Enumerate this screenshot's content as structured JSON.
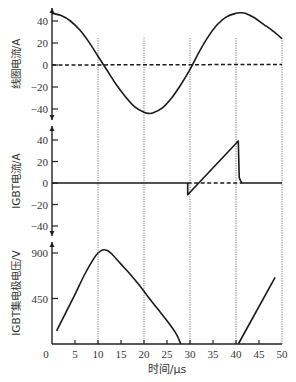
{
  "chart_data": {
    "type": "line",
    "title": "",
    "xlabel": "时间/µs",
    "xlim": [
      0,
      50
    ],
    "x_ticks": [
      0,
      5,
      10,
      15,
      20,
      25,
      30,
      35,
      40,
      45,
      50
    ],
    "vertical_dotted_lines_at": [
      10,
      20,
      30,
      40,
      50
    ],
    "grid": false,
    "panels": [
      {
        "id": "coil-current",
        "ylabel": "线圈电流/A",
        "ylim": [
          -50,
          50
        ],
        "y_ticks": [
          40,
          20,
          0,
          -20,
          -40
        ],
        "series": [
          {
            "name": "线圈电流",
            "style": "solid",
            "x": [
              0,
              2,
              4,
              6,
              8,
              10,
              12,
              14,
              16,
              18,
              20,
              21,
              22,
              24,
              26,
              28,
              30,
              32,
              34,
              36,
              38,
              40,
              41,
              42,
              44,
              46,
              48,
              50
            ],
            "y": [
              47,
              45,
              40,
              32,
              21,
              8,
              -5,
              -18,
              -29,
              -38,
              -43,
              -44,
              -43.5,
              -39,
              -30,
              -18,
              -4,
              12,
              26,
              37,
              44,
              47,
              47.5,
              47,
              43,
              37,
              31,
              24
            ]
          },
          {
            "name": "零电流参考",
            "style": "dashed",
            "x": [
              0,
              50
            ],
            "y": [
              0,
              0.5
            ]
          }
        ]
      },
      {
        "id": "igbt-current",
        "ylabel": "IGBT电流/A",
        "ylim": [
          -50,
          50
        ],
        "y_ticks": [
          40,
          20,
          0,
          -20,
          -40
        ],
        "series": [
          {
            "name": "IGBT电流",
            "style": "solid",
            "x": [
              0,
              29.5,
              29.5,
              40.5,
              40.5,
              40.7,
              41,
              41.3,
              50
            ],
            "y": [
              0,
              0,
              -11,
              39,
              39,
              5,
              2,
              0,
              0
            ]
          },
          {
            "name": "零电流虚线",
            "style": "dashed",
            "x": [
              29.5,
              41.3
            ],
            "y": [
              0,
              0
            ]
          }
        ]
      },
      {
        "id": "igbt-vce",
        "ylabel": "IGBT集电极电压/V",
        "ylim": [
          0,
          980
        ],
        "y_ticks": [
          900,
          450
        ],
        "series": [
          {
            "name": "IGBT集电极电压",
            "style": "solid",
            "segments": [
              {
                "x": [
                  1,
                  3,
                  5,
                  7,
                  9,
                  10,
                  11,
                  12,
                  13,
                  15,
                  17,
                  19,
                  21,
                  23,
                  25,
                  27,
                  28
                ],
                "y": [
                  130,
                  310,
                  490,
                  680,
                  840,
                  900,
                  930,
                  925,
                  890,
                  790,
                  690,
                  580,
                  460,
                  345,
                  230,
                  100,
                  0
                ]
              },
              {
                "x": [
                  40.5,
                  48.5
                ],
                "y": [
                  0,
                  660
                ]
              }
            ]
          }
        ]
      }
    ]
  },
  "labels": {
    "xlabel": "时间/µs",
    "panel1_ylabel": "线圈电流/A",
    "panel2_ylabel": "IGBT电流/A",
    "panel3_ylabel": "IGBT集电极电压/V"
  }
}
